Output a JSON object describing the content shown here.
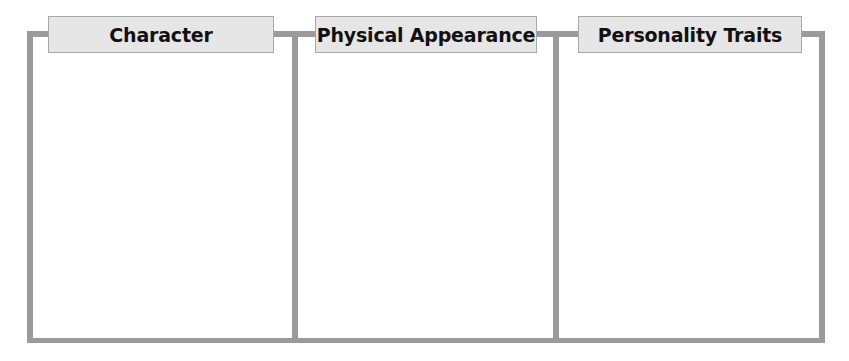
{
  "organizer": {
    "title": "Character traits graphic organizer",
    "frame_color": "#9b9b9b",
    "label_background": "#e6e6e6",
    "columns": [
      {
        "label": "Character",
        "content": ""
      },
      {
        "label": "Physical Appearance",
        "content": ""
      },
      {
        "label": "Personality Traits",
        "content": ""
      }
    ]
  }
}
